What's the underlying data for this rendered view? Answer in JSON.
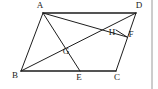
{
  "figure": {
    "canvas": {
      "width": 158,
      "height": 89,
      "background": "#ffffff"
    },
    "stroke_color": "#1d1d1d",
    "label_color": "#1a1a1a",
    "rule_color": "#9a9a9a",
    "points": {
      "A": {
        "label": "A",
        "x": 43,
        "y": 13,
        "label_x": 40,
        "label_y": 6
      },
      "B": {
        "label": "B",
        "x": 21,
        "y": 71,
        "label_x": 15,
        "label_y": 76
      },
      "C": {
        "label": "C",
        "x": 116,
        "y": 71,
        "label_x": 117,
        "label_y": 78
      },
      "D": {
        "label": "D",
        "x": 136,
        "y": 13,
        "label_x": 139,
        "label_y": 6
      },
      "E": {
        "label": "E",
        "x": 80,
        "y": 71,
        "label_x": 79,
        "label_y": 78
      },
      "F": {
        "label": "F",
        "x": 127,
        "y": 37,
        "label_x": 131,
        "label_y": 35
      },
      "G": {
        "label": "G",
        "x": 70,
        "y": 48,
        "label_x": 66,
        "label_y": 52
      },
      "H": {
        "label": "H",
        "x": 116,
        "y": 30,
        "label_x": 112,
        "label_y": 33
      }
    },
    "segments": [
      {
        "name": "segment-AD",
        "from": "A",
        "to": "D",
        "weight": "thick"
      },
      {
        "name": "segment-AB",
        "from": "A",
        "to": "B",
        "weight": "normal"
      },
      {
        "name": "segment-BC",
        "from": "B",
        "to": "C",
        "weight": "thick"
      },
      {
        "name": "segment-DC",
        "from": "D",
        "to": "C",
        "weight": "normal"
      },
      {
        "name": "segment-AE",
        "from": "A",
        "to": "E",
        "weight": "normal"
      },
      {
        "name": "segment-AF",
        "from": "A",
        "to": "F",
        "weight": "normal"
      },
      {
        "name": "segment-BD",
        "from": "B",
        "to": "D",
        "weight": "normal"
      },
      {
        "name": "segment-HF",
        "from": "H",
        "to": "F",
        "weight": "normal"
      }
    ],
    "right_rule": {
      "name": "right-edge-rule",
      "x": 152,
      "y1": 0,
      "y2": 89
    }
  }
}
